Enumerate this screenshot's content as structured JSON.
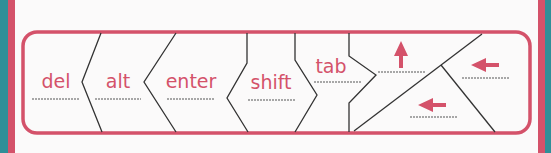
{
  "colors": {
    "accent": "#d4526a",
    "background": "#2f8f98",
    "card": "#fbfafa",
    "line": "#333333"
  },
  "keys": [
    {
      "label": "del"
    },
    {
      "label": "alt"
    },
    {
      "label": "enter"
    },
    {
      "label": "shift"
    },
    {
      "label": "tab"
    }
  ],
  "arrow_keys": [
    {
      "icon": "arrow-up-icon"
    },
    {
      "icon": "arrow-left-icon"
    },
    {
      "icon": "arrow-left-icon"
    }
  ]
}
